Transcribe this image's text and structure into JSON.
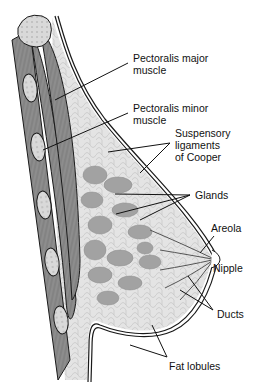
{
  "diagram": {
    "type": "anatomical-cross-section",
    "labels": [
      {
        "id": "pectoralis-major",
        "text": "Pectoralis major\nmuscle",
        "x": 133,
        "y": 52
      },
      {
        "id": "pectoralis-minor",
        "text": "Pectoralis minor\nmuscle",
        "x": 133,
        "y": 102
      },
      {
        "id": "suspensory-ligaments",
        "text": "Suspensory\nligaments\nof Cooper",
        "x": 175,
        "y": 127
      },
      {
        "id": "glands",
        "text": "Glands",
        "x": 195,
        "y": 189
      },
      {
        "id": "areola",
        "text": "Areola",
        "x": 211,
        "y": 222
      },
      {
        "id": "nipple",
        "text": "Nipple",
        "x": 213,
        "y": 262
      },
      {
        "id": "ducts",
        "text": "Ducts",
        "x": 217,
        "y": 308
      },
      {
        "id": "fat-lobules",
        "text": "Fat lobules",
        "x": 169,
        "y": 360
      }
    ],
    "colors": {
      "background": "#ffffff",
      "outline": "#1a1a1a",
      "muscle": "#8c8c8c",
      "rib": "#d8d8d8",
      "fat": "#e6e6e6",
      "gland": "#a0a0a0",
      "skin": "#ffffff"
    }
  }
}
